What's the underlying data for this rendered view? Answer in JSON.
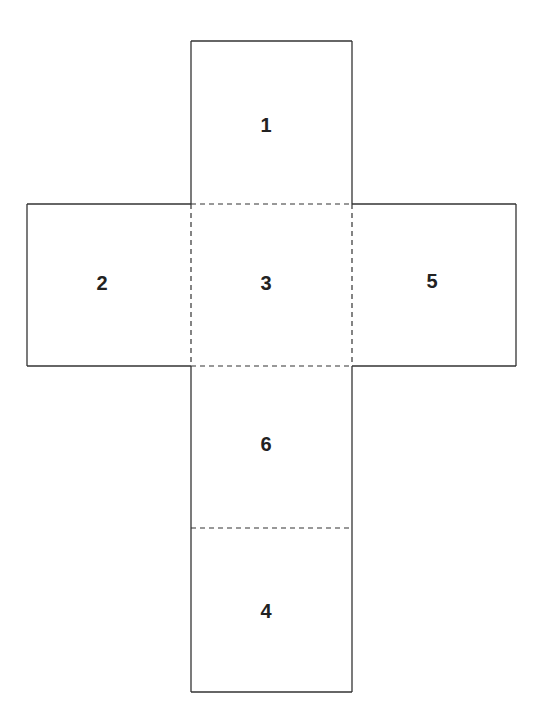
{
  "diagram": {
    "type": "cube-net",
    "line_color": "#333333",
    "faces": [
      {
        "id": "face-1",
        "label": "1",
        "position": "top"
      },
      {
        "id": "face-2",
        "label": "2",
        "position": "left"
      },
      {
        "id": "face-3",
        "label": "3",
        "position": "center"
      },
      {
        "id": "face-5",
        "label": "5",
        "position": "right"
      },
      {
        "id": "face-6",
        "label": "6",
        "position": "below-center"
      },
      {
        "id": "face-4",
        "label": "4",
        "position": "bottom"
      }
    ],
    "fold_lines": "dashed",
    "cut_lines": "solid"
  }
}
